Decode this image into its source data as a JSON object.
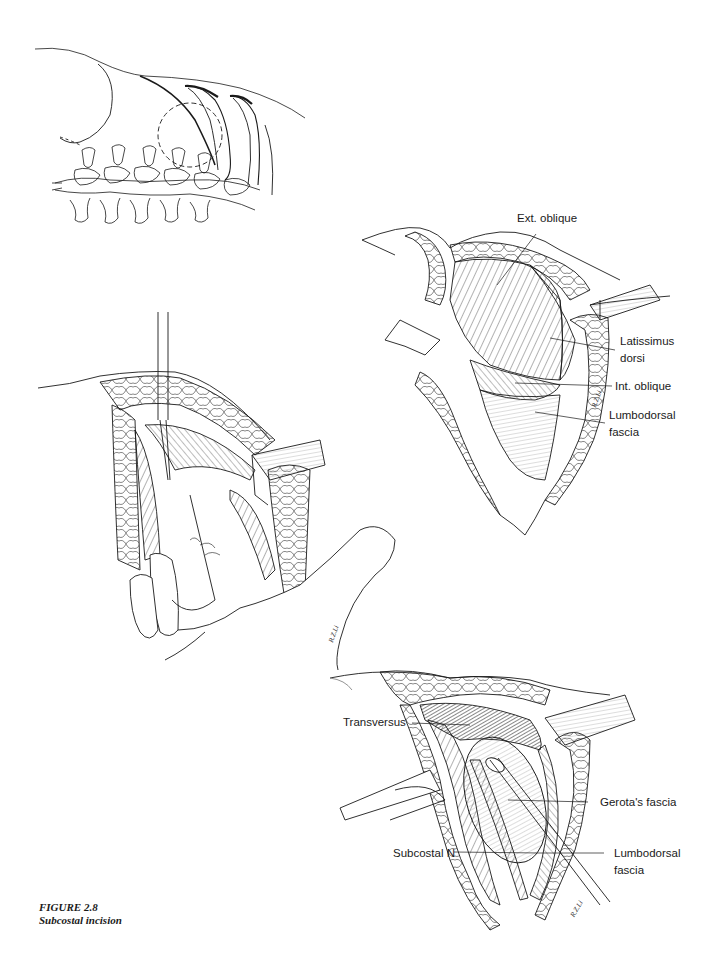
{
  "figure": {
    "number_label": "FIGURE 2.8",
    "title": "Subcostal incision"
  },
  "panels": [
    {
      "id": "spine-overview",
      "description": "Lateral view of spine and lower ribs with dashed circle marking incision area",
      "labels": []
    },
    {
      "id": "muscle-layer",
      "labels": [
        {
          "text": "Ext. oblique"
        },
        {
          "text_line1": "Latissimus",
          "text_line2": "dorsi"
        },
        {
          "text": "Int. oblique"
        },
        {
          "text_line1": "Lumbodorsal",
          "text_line2": "fascia"
        }
      ],
      "signature": "R.Z.Li"
    },
    {
      "id": "finger-dissection",
      "description": "Surgeon's finger sweeping beneath muscle layer with instrument",
      "labels": [],
      "signature": "R.Z.Li"
    },
    {
      "id": "deep-layer",
      "labels": [
        {
          "text": "Transversus"
        },
        {
          "text": "Gerota's fascia"
        },
        {
          "text": "Subcostal N"
        },
        {
          "text_line1": "Lumbodorsal",
          "text_line2": "fascia"
        }
      ],
      "signature": "R.Z.Li"
    }
  ],
  "colors": {
    "ink": "#1a1a1a",
    "paper": "#ffffff"
  }
}
